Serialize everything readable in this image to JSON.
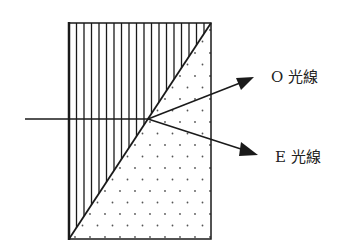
{
  "diagram": {
    "labels": {
      "o_ray": "O 光線",
      "e_ray": "E 光線"
    },
    "regions": [
      {
        "name": "upper-left-prism",
        "fill": "vertical-hatch"
      },
      {
        "name": "lower-right-prism",
        "fill": "dots"
      }
    ],
    "colors": {
      "line": "#1a1a1a",
      "background": "#ffffff"
    }
  }
}
